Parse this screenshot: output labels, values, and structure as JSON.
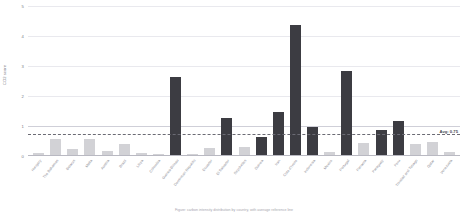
{
  "chart_data": {
    "type": "bar",
    "title": "",
    "xlabel": "",
    "ylabel": "CO2 score",
    "ylim": [
      0,
      5
    ],
    "yticks": [
      0,
      1,
      2,
      3,
      4,
      5
    ],
    "grid": true,
    "legend": null,
    "threshold_line": {
      "value": 1,
      "style": "solid",
      "color": "#cfcfd8"
    },
    "average_line": {
      "value": 0.75,
      "style": "dashed",
      "color": "#6b6b74",
      "label": "Avg: 0.75"
    },
    "categories": [
      "Hungary",
      "The Bahamas",
      "Belarus",
      "Malta",
      "Austria",
      "Brazil",
      "Libya",
      "Colombia",
      "Guinea-Bissau",
      "Dominican Republic",
      "Ecuador",
      "El Salvador",
      "Seychelles",
      "Guinea",
      "Iran",
      "Cote d'Ivoire",
      "Indonesia",
      "Mexico",
      "Portugal",
      "Panama",
      "Paraguay",
      "Peru",
      "Trinidad and Tobago",
      "Qatar",
      "Venezuela"
    ],
    "values": [
      0.08,
      0.52,
      0.2,
      0.55,
      0.12,
      0.38,
      0.06,
      0.05,
      2.6,
      0.05,
      0.22,
      1.25,
      0.28,
      0.6,
      1.45,
      4.35,
      0.95,
      0.1,
      2.8,
      0.4,
      0.85,
      1.15,
      0.38,
      0.42,
      0.1
    ],
    "bar_styles": [
      "light",
      "light",
      "light",
      "light",
      "light",
      "light",
      "light",
      "light",
      "dark",
      "light",
      "light",
      "dark",
      "light",
      "dark",
      "dark",
      "dark",
      "dark",
      "light",
      "dark",
      "light",
      "dark",
      "dark",
      "light",
      "light",
      "light"
    ],
    "colors": {
      "dark": "#3c3c42",
      "light": "#d2d2d6"
    }
  },
  "caption": "Figure: carbon intensity distribution by country, with average reference line"
}
